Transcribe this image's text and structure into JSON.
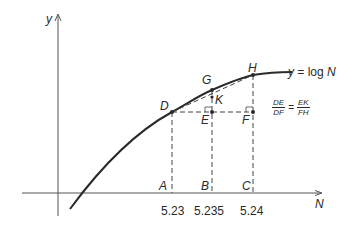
{
  "diagram": {
    "axes": {
      "y_label": "y",
      "x_label": "N"
    },
    "curve_label": {
      "lhs": "y",
      "eq": "=",
      "rhs_func": "log",
      "rhs_var": "N"
    },
    "points": {
      "D": "D",
      "E": "E",
      "F": "F",
      "G": "G",
      "H": "H",
      "K": "K",
      "A": "A",
      "B": "B",
      "C": "C"
    },
    "ticks": {
      "A": "5.23",
      "B": "5.235",
      "C": "5.24"
    },
    "ratio": {
      "left_num": "DE",
      "left_den": "DF",
      "op": "=",
      "right_num": "EK",
      "right_den": "FH"
    },
    "colors": {
      "ink": "#2a2a2a",
      "axis": "#555555",
      "background": "#ffffff"
    }
  }
}
